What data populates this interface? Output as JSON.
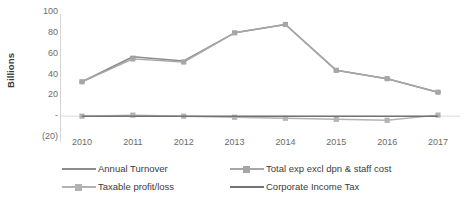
{
  "chart_data": {
    "type": "line",
    "title": "",
    "xlabel": "",
    "ylabel": "Billions",
    "categories": [
      "2010",
      "2011",
      "2012",
      "2013",
      "2014",
      "2015",
      "2016",
      "2017"
    ],
    "ylim": [
      -20,
      100
    ],
    "yticks": [
      "100",
      "80",
      "60",
      "40",
      "20",
      "-",
      "(20)"
    ],
    "ytick_values": [
      100,
      80,
      60,
      40,
      20,
      0,
      -20
    ],
    "grid": false,
    "legend_position": "bottom",
    "series": [
      {
        "name": "Annual Turnover",
        "color": "#8c8c8c",
        "marker": "dash",
        "values": [
          33,
          57,
          53,
          80,
          88,
          44,
          36,
          23
        ]
      },
      {
        "name": "Total exp excl dpn & staff cost",
        "color": "#a6a6a6",
        "marker": "square",
        "values": [
          33,
          55,
          52,
          80,
          88,
          44,
          36,
          23
        ]
      },
      {
        "name": "Taxable profit/loss",
        "color": "#b3b3b3",
        "marker": "square",
        "values": [
          0,
          1,
          0,
          -1,
          -2,
          -3,
          -4,
          1
        ]
      },
      {
        "name": "Corporate Income Tax",
        "color": "#737373",
        "marker": "none",
        "values": [
          0,
          0,
          0,
          0,
          0,
          0,
          0,
          0
        ]
      }
    ]
  },
  "legend": {
    "rows": [
      [
        "Annual Turnover",
        "Total exp excl dpn & staff cost"
      ],
      [
        "Taxable profit/loss",
        "Corporate Income Tax"
      ]
    ]
  }
}
